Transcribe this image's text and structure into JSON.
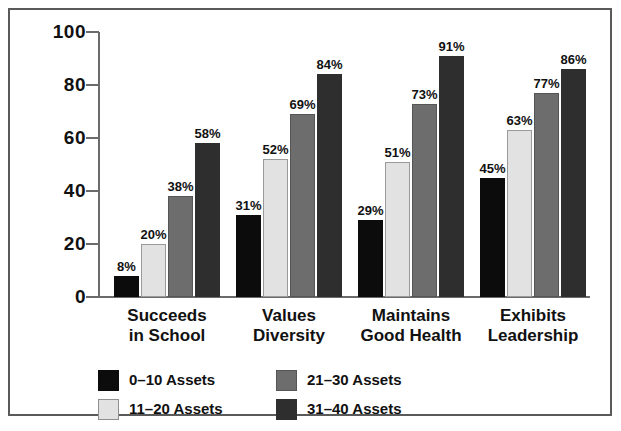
{
  "chart_data": {
    "type": "bar",
    "title": "",
    "subtitle": "",
    "xlabel": "",
    "ylabel": "",
    "ylim": [
      0,
      100
    ],
    "yticks": [
      0,
      20,
      40,
      60,
      80,
      100
    ],
    "ytick_labels": [
      "0",
      "20",
      "40",
      "60",
      "80",
      "100"
    ],
    "grid": false,
    "legend_position": "bottom-left",
    "value_label_suffix": "%",
    "categories": [
      "Succeeds\nin School",
      "Values\nDiversity",
      "Maintains\nGood Health",
      "Exhibits\nLeadership"
    ],
    "series": [
      {
        "name": "0–10 Assets",
        "color": "#0c0c0c",
        "values": [
          8,
          31,
          29,
          45
        ],
        "labels": [
          "8%",
          "31%",
          "29%",
          "45%"
        ]
      },
      {
        "name": "11–20 Assets",
        "color": "#e2e2e2",
        "values": [
          20,
          52,
          51,
          63
        ],
        "labels": [
          "20%",
          "52%",
          "51%",
          "63%"
        ]
      },
      {
        "name": "21–30 Assets",
        "color": "#6d6d6d",
        "values": [
          38,
          69,
          73,
          77
        ],
        "labels": [
          "38%",
          "69%",
          "73%",
          "77%"
        ]
      },
      {
        "name": "31–40 Assets",
        "color": "#2e2e2e",
        "values": [
          58,
          84,
          91,
          86
        ],
        "labels": [
          "58%",
          "84%",
          "91%",
          "86%"
        ]
      }
    ]
  },
  "legend": {
    "columns": [
      [
        {
          "swatch": 0,
          "label": "0–10 Assets"
        },
        {
          "swatch": 1,
          "label": "11–20 Assets"
        }
      ],
      [
        {
          "swatch": 2,
          "label": "21–30 Assets"
        },
        {
          "swatch": 3,
          "label": "31–40 Assets"
        }
      ]
    ]
  },
  "colors": {
    "frame": "#5a5a5a",
    "axis": "#6b6b6b",
    "text": "#111111",
    "background": "#ffffff"
  }
}
